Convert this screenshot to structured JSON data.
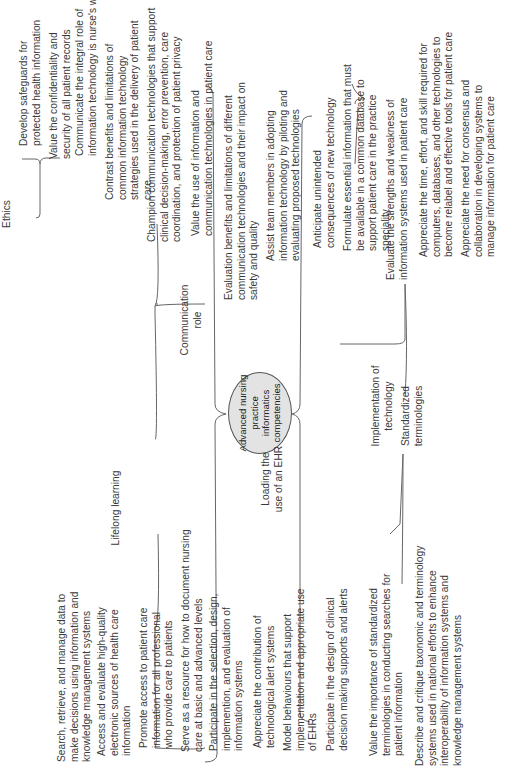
{
  "diagram": {
    "center": "Advanced nursing practice informatics competencies",
    "branches": [
      {
        "label": "Ethics",
        "items": [
          "Develop safeguards for protected health information",
          "Value the confidentiality and security of all patient records"
        ]
      },
      {
        "label": "Communication role",
        "items": [
          "Communicate the integral role of information technology is nurse's work",
          "Contrast benefits and limitations of common information technology strategies used in the delivery of patient care",
          "Champion communication technologies that support clinical decision-making, error prevention, care coordination, and protection of patient privacy",
          "Value the use of information and communication technologies in patient care",
          "Evaluation benefits and limitations of different communication technologies and their impact on safety and quality"
        ]
      },
      {
        "label": "Implementation of technology",
        "items": [
          "Assist team members in adopting information technology by piloting and evaluating proposed technologies",
          "Anticipate unintended consequences of new technology",
          "Formulate essential information that must be available in a common database to support patient care in the practice speciality",
          "Evaluate the strengths and weakness of information systems used in patient care",
          "Appreciate the time, effort, and skill required for computers, databases, and other technologies to become relabel and effective tools for patient care",
          "Appreciate the need for consensus and collaboration in developing systems to manage information for patient care"
        ]
      },
      {
        "label": "Lifelong learning",
        "items": [
          "Search, retrieve, and manage data to make decisions using information and knowledge management systems",
          "Access and evaluate high-quality electronic sources of health care information",
          "Promote access to patient care information for all professional who provide care to patients",
          "Serve as a resource for how to document nursing care at basic and advanced levels"
        ]
      },
      {
        "label": "Loading the use of an EHR",
        "items": [
          "Participate in the selection, design, implemention, and evaluation of information systems",
          "Appreciate the contribution of technological alert systems",
          "Model behaviours that support implementation and appropriate use of EHRs",
          "Participate in the design of clinical decision making supports and alerts"
        ]
      },
      {
        "label": "Standardized terminologies",
        "items": [
          "Value the importance of standardized terminologies in conducting searches for patient information",
          "Describe and critique taxonomic and terminology systems used in national efforts to enhance interoperability of information systems and knowledge management systems"
        ]
      }
    ]
  },
  "colors": {
    "hub_fill": "#e3e3e3",
    "line": "#555555",
    "text": "#3a3a3a"
  }
}
